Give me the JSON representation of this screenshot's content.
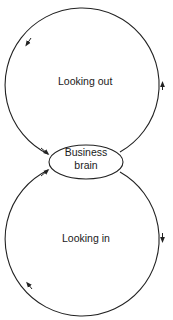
{
  "diagram": {
    "type": "two-loop cycle diagram",
    "top_loop": {
      "label": "Looking out",
      "direction": "counterclockwise"
    },
    "bottom_loop": {
      "label": "Looking in",
      "direction": "clockwise"
    },
    "center_node": {
      "line1": "Business",
      "line2": "brain"
    },
    "colors": {
      "stroke": "#222222",
      "background": "#ffffff",
      "text": "#1a1a1a"
    }
  }
}
